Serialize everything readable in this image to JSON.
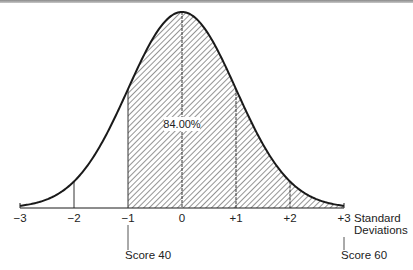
{
  "chart_data": {
    "type": "area",
    "title": "",
    "xlabel": "Standard Deviations",
    "ylabel": "",
    "x_ticks": [
      -3,
      -2,
      -1,
      0,
      1,
      2,
      3
    ],
    "x_tick_labels": [
      "−3",
      "−2",
      "−1",
      "0",
      "+1",
      "+2",
      "+3"
    ],
    "xlim": [
      -3,
      3
    ],
    "distribution": {
      "mean": 0,
      "sd": 1,
      "shape": "normal"
    },
    "curve_points": [
      {
        "z": -3,
        "rel_height": 0.011
      },
      {
        "z": -2,
        "rel_height": 0.135
      },
      {
        "z": -1,
        "rel_height": 0.607
      },
      {
        "z": 0,
        "rel_height": 1.0
      },
      {
        "z": 1,
        "rel_height": 0.607
      },
      {
        "z": 2,
        "rel_height": 0.135
      },
      {
        "z": 3,
        "rel_height": 0.011
      }
    ],
    "shaded_region": {
      "from_z": -1,
      "to_z": 3,
      "pattern": "diagonal-hatch",
      "label": "84.00%"
    },
    "vertical_lines_at": [
      -2,
      -1,
      0,
      1,
      2
    ],
    "annotations": [
      {
        "z": -1,
        "text": "Score 40"
      },
      {
        "z": 3,
        "text": "Score 60"
      }
    ],
    "grid": false,
    "legend": null
  },
  "axis": {
    "title_line1": "Standard",
    "title_line2": "Deviations",
    "ticks": [
      {
        "label": "−3"
      },
      {
        "label": "−2"
      },
      {
        "label": "−1"
      },
      {
        "label": "0"
      },
      {
        "label": "+1"
      },
      {
        "label": "+2"
      },
      {
        "label": "+3"
      }
    ]
  },
  "shaded_area_label": "84.00%",
  "score_low": {
    "label": "Score 40"
  },
  "score_high": {
    "label": "Score 60"
  },
  "colors": {
    "line": "#1a1a1a",
    "hatch": "#555555",
    "background": "#ffffff"
  }
}
